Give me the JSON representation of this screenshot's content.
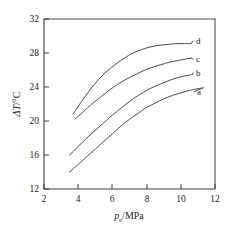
{
  "chart_data": {
    "type": "line",
    "title": "",
    "xlabel": "p_e/MPa",
    "xlabel_symbol": "p",
    "xlabel_subscript": "e",
    "xlabel_unit": "/MPa",
    "ylabel": "ΔT/°C",
    "ylabel_symbol": "ΔT",
    "ylabel_unit": "/°C",
    "xlim": [
      2,
      12
    ],
    "ylim": [
      12,
      32
    ],
    "xticks": [
      2,
      4,
      6,
      8,
      10,
      12
    ],
    "yticks": [
      12,
      16,
      20,
      24,
      28,
      32
    ],
    "grid": false,
    "legend_position": "right-inline-labels",
    "series": [
      {
        "name": "a",
        "label": "a",
        "x": [
          3.5,
          4.0,
          4.5,
          5.0,
          5.5,
          6.0,
          6.5,
          7.0,
          7.5,
          8.0,
          8.5,
          9.0,
          9.5,
          10.0,
          10.5,
          11.0,
          11.3
        ],
        "y": [
          14.0,
          14.9,
          15.8,
          16.7,
          17.6,
          18.5,
          19.4,
          20.2,
          20.9,
          21.6,
          22.1,
          22.6,
          23.0,
          23.3,
          23.6,
          23.8,
          23.9
        ]
      },
      {
        "name": "b",
        "label": "b",
        "x": [
          3.5,
          4.0,
          4.5,
          5.0,
          5.5,
          6.0,
          6.5,
          7.0,
          7.5,
          8.0,
          8.5,
          9.0,
          9.5,
          10.0,
          10.5,
          10.7
        ],
        "y": [
          16.0,
          17.0,
          18.0,
          18.9,
          19.8,
          20.7,
          21.5,
          22.3,
          23.0,
          23.6,
          24.1,
          24.5,
          24.9,
          25.2,
          25.4,
          25.5
        ]
      },
      {
        "name": "c",
        "label": "c",
        "x": [
          3.8,
          4.3,
          4.8,
          5.3,
          5.8,
          6.3,
          6.8,
          7.3,
          7.8,
          8.3,
          8.8,
          9.3,
          9.8,
          10.3,
          10.6
        ],
        "y": [
          20.2,
          21.1,
          22.0,
          22.8,
          23.6,
          24.3,
          24.9,
          25.4,
          25.9,
          26.3,
          26.6,
          26.9,
          27.1,
          27.3,
          27.4
        ]
      },
      {
        "name": "d",
        "label": "d",
        "x": [
          3.7,
          4.2,
          4.7,
          5.2,
          5.7,
          6.2,
          6.7,
          7.2,
          7.7,
          8.2,
          8.7,
          9.2,
          9.7,
          10.2,
          10.6
        ],
        "y": [
          20.8,
          22.3,
          23.7,
          24.9,
          25.9,
          26.7,
          27.4,
          28.0,
          28.4,
          28.7,
          28.9,
          29.0,
          29.1,
          29.1,
          29.1
        ]
      }
    ],
    "series_labels": [
      {
        "name": "d",
        "text": "d",
        "px": 196,
        "py": 44
      },
      {
        "name": "c",
        "text": "c",
        "px": 196,
        "py": 62
      },
      {
        "name": "b",
        "text": "b",
        "px": 196,
        "py": 76
      },
      {
        "name": "a",
        "text": "a",
        "px": 197,
        "py": 95
      }
    ]
  }
}
